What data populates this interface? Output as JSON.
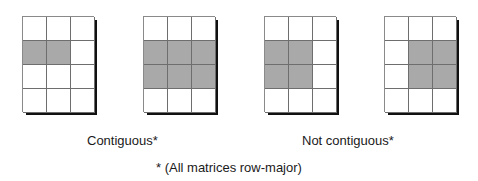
{
  "diagram": {
    "colors": {
      "filled": "#a9a9a9",
      "empty": "#ffffff",
      "shadow": "#111111",
      "gridline": "#6e6e6e"
    },
    "matrices": [
      {
        "id": "m1",
        "group": "contiguous",
        "rows": 4,
        "cols": 3,
        "cells": [
          [
            0,
            0,
            0
          ],
          [
            1,
            1,
            0
          ],
          [
            0,
            0,
            0
          ],
          [
            0,
            0,
            0
          ]
        ]
      },
      {
        "id": "m2",
        "group": "contiguous",
        "rows": 4,
        "cols": 3,
        "cells": [
          [
            0,
            0,
            0
          ],
          [
            1,
            1,
            1
          ],
          [
            1,
            1,
            1
          ],
          [
            0,
            0,
            0
          ]
        ]
      },
      {
        "id": "m3",
        "group": "not-contiguous",
        "rows": 4,
        "cols": 3,
        "cells": [
          [
            0,
            0,
            0
          ],
          [
            1,
            1,
            0
          ],
          [
            1,
            1,
            0
          ],
          [
            0,
            0,
            0
          ]
        ]
      },
      {
        "id": "m4",
        "group": "not-contiguous",
        "rows": 4,
        "cols": 3,
        "cells": [
          [
            0,
            0,
            0
          ],
          [
            0,
            1,
            1
          ],
          [
            0,
            1,
            1
          ],
          [
            0,
            0,
            0
          ]
        ]
      }
    ],
    "labels": {
      "contiguous": "Contiguous*",
      "not_contiguous": "Not contiguous*",
      "footnote": "* (All matrices row-major)"
    }
  }
}
